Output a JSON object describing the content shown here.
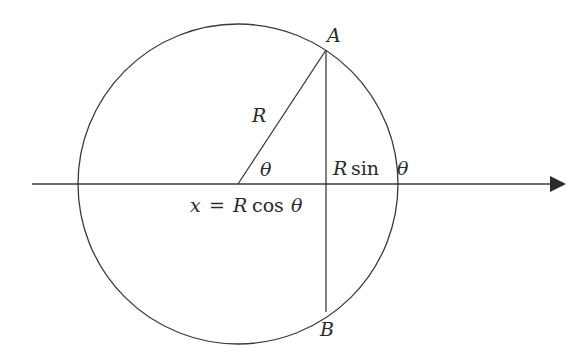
{
  "diagram": {
    "type": "geometry",
    "stroke_color": "#3a3a3a",
    "circle": {
      "cx": 238,
      "cy": 184,
      "r": 160
    },
    "axis": {
      "x1": 32,
      "y": 184,
      "x2": 566,
      "arrow": "right"
    },
    "radius_line": {
      "from": [
        238,
        184
      ],
      "to": [
        326,
        50
      ]
    },
    "chord": {
      "x": 326,
      "y1": 50,
      "y2": 312
    },
    "labels": {
      "point_a": "A",
      "point_b": "B",
      "radius": "R",
      "angle": "θ",
      "vertical": "R sin θ",
      "vertical_r": "R",
      "vertical_sin": "sin",
      "vertical_theta": "θ",
      "horizontal_x": "x",
      "horizontal_eq": "=",
      "horizontal_r": "R",
      "horizontal_cos": "cos",
      "horizontal_theta": "θ"
    }
  }
}
